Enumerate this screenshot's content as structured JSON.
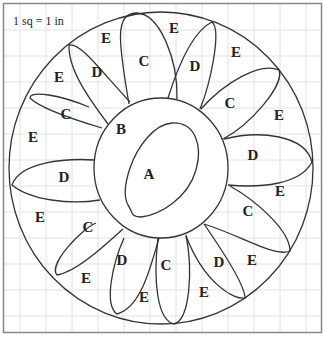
{
  "figure": {
    "scale_label": "1 sq = 1 in",
    "colors": {
      "stroke": "#333333",
      "grid": "#e2e2e2",
      "frame": "#888888",
      "background": "#ffffff"
    },
    "regions": {
      "A": "A",
      "B": "B"
    },
    "labels": [
      {
        "text": "E",
        "x": 106,
        "y": 40
      },
      {
        "text": "C",
        "x": 144,
        "y": 63
      },
      {
        "text": "E",
        "x": 174,
        "y": 30
      },
      {
        "text": "D",
        "x": 195,
        "y": 68
      },
      {
        "text": "E",
        "x": 236,
        "y": 54
      },
      {
        "text": "E",
        "x": 59,
        "y": 79
      },
      {
        "text": "D",
        "x": 97,
        "y": 74
      },
      {
        "text": "C",
        "x": 66,
        "y": 116
      },
      {
        "text": "C",
        "x": 230,
        "y": 105
      },
      {
        "text": "E",
        "x": 279,
        "y": 117
      },
      {
        "text": "E",
        "x": 33,
        "y": 139
      },
      {
        "text": "B",
        "x": 121,
        "y": 131
      },
      {
        "text": "D",
        "x": 253,
        "y": 157
      },
      {
        "text": "D",
        "x": 64,
        "y": 179
      },
      {
        "text": "A",
        "x": 149,
        "y": 176
      },
      {
        "text": "E",
        "x": 280,
        "y": 193
      },
      {
        "text": "E",
        "x": 40,
        "y": 219
      },
      {
        "text": "C",
        "x": 248,
        "y": 213
      },
      {
        "text": "C",
        "x": 88,
        "y": 229
      },
      {
        "text": "D",
        "x": 122,
        "y": 262
      },
      {
        "text": "C",
        "x": 166,
        "y": 267
      },
      {
        "text": "D",
        "x": 219,
        "y": 264
      },
      {
        "text": "E",
        "x": 252,
        "y": 262
      },
      {
        "text": "E",
        "x": 86,
        "y": 280
      },
      {
        "text": "E",
        "x": 144,
        "y": 299
      },
      {
        "text": "E",
        "x": 204,
        "y": 294
      }
    ]
  }
}
